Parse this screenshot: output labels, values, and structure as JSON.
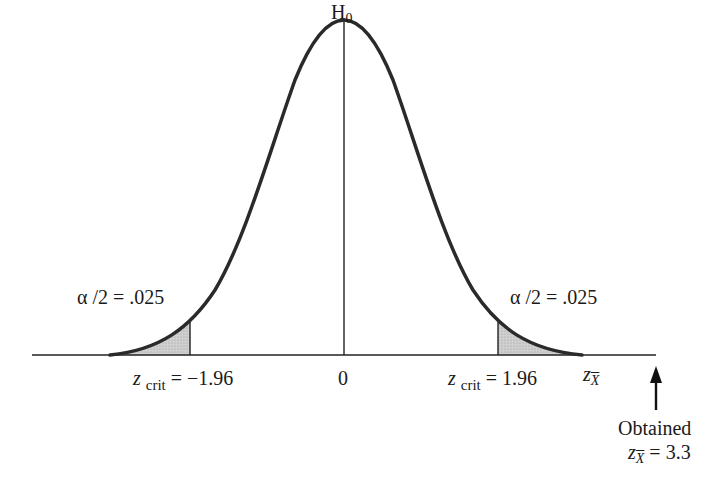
{
  "diagram": {
    "type": "normal-distribution-two-tailed-test",
    "peak_label": {
      "main": "H",
      "sub": "0"
    },
    "center_tick_label": "0",
    "left_tail": {
      "area_label": "α /2 = .025",
      "crit_label_var": "z",
      "crit_label_sub": "crit",
      "crit_label_value": " = −1.96"
    },
    "right_tail": {
      "area_label": "α /2 = .025",
      "crit_label_var": "z",
      "crit_label_sub": "crit",
      "crit_label_value": " = 1.96"
    },
    "axis_label": {
      "var": "z",
      "sub": "X"
    },
    "obtained": {
      "line1": "Obtained",
      "var": "z",
      "sub": "X",
      "value": " = 3.3"
    },
    "colors": {
      "curve": "#2a2a2a",
      "shade": "#c8c8c8",
      "axis": "#222222",
      "background": "#ffffff"
    }
  }
}
